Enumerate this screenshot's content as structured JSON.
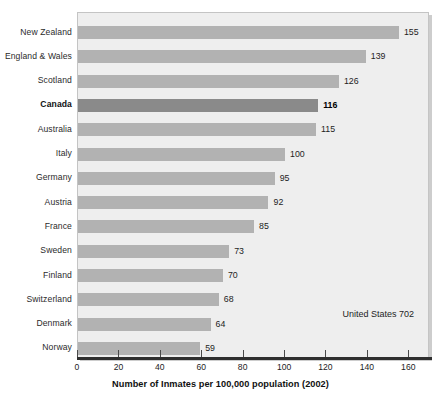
{
  "chart_data": {
    "type": "bar",
    "orientation": "horizontal",
    "title": "",
    "xlabel": "Number of Inmates per 100,000 population (2002)",
    "ylabel": "",
    "xlim": [
      0,
      170
    ],
    "xticks": [
      0,
      20,
      40,
      60,
      80,
      100,
      120,
      140,
      160
    ],
    "grid": false,
    "legend": null,
    "categories": [
      "New Zealand",
      "England & Wales",
      "Scotland",
      "Canada",
      "Australia",
      "Italy",
      "Germany",
      "Austria",
      "France",
      "Sweden",
      "Finland",
      "Switzerland",
      "Denmark",
      "Norway"
    ],
    "values": [
      155,
      139,
      126,
      116,
      115,
      100,
      95,
      92,
      85,
      73,
      70,
      68,
      64,
      59
    ],
    "value_labels": [
      "155",
      "139",
      "126",
      "116",
      "115",
      "100",
      "95",
      "92",
      "85",
      "73",
      "70",
      "68",
      "64",
      "59"
    ],
    "highlight_category": "Canada",
    "annotations": [
      {
        "text": "United States 702",
        "value": 702
      }
    ],
    "colors": {
      "bar": "#b2b2b2",
      "bar_highlight": "#8a8a8a",
      "plot_background": "#eeeeee",
      "plot_border": "#c4c4c4",
      "axis_line": "#2e2e2e",
      "text": "#1d1d1d"
    }
  }
}
